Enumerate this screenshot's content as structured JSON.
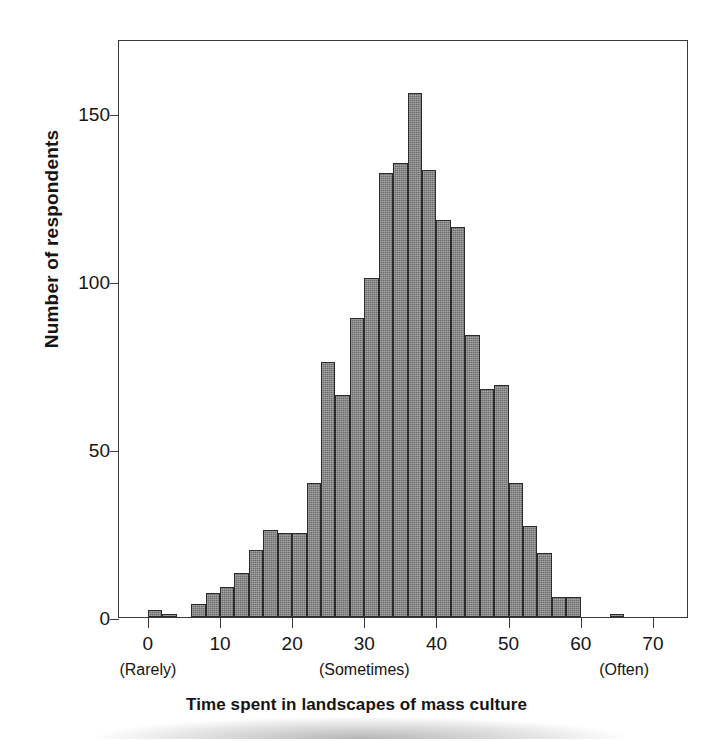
{
  "chart_data": {
    "type": "bar",
    "title": "",
    "subtitle": "",
    "xlabel": "Time spent in landscapes of mass culture",
    "ylabel": "Number of respondents",
    "xlim": [
      -4,
      75
    ],
    "ylim": [
      0,
      172
    ],
    "grid": false,
    "legend": null,
    "bin_width": 2,
    "x_ticks": [
      0,
      10,
      20,
      30,
      40,
      50,
      60,
      70
    ],
    "x_tick_labels": [
      "0",
      "10",
      "20",
      "30",
      "40",
      "50",
      "60",
      "70"
    ],
    "y_ticks": [
      0,
      50,
      100,
      150
    ],
    "y_tick_labels": [
      "0",
      "50",
      "100",
      "150"
    ],
    "anchor_labels": [
      {
        "x": 0,
        "text": "(Rarely)"
      },
      {
        "x": 30,
        "text": "(Sometimes)"
      },
      {
        "x": 66,
        "text": "(Often)"
      }
    ],
    "bar_color": "#6e6e6e",
    "bar_edge_color": "#2b2b2b",
    "bins": [
      {
        "x0": 0,
        "x1": 2,
        "value": 2
      },
      {
        "x0": 2,
        "x1": 4,
        "value": 1
      },
      {
        "x0": 4,
        "x1": 6,
        "value": 0
      },
      {
        "x0": 6,
        "x1": 8,
        "value": 4
      },
      {
        "x0": 8,
        "x1": 10,
        "value": 7
      },
      {
        "x0": 10,
        "x1": 12,
        "value": 9
      },
      {
        "x0": 12,
        "x1": 14,
        "value": 13
      },
      {
        "x0": 14,
        "x1": 16,
        "value": 20
      },
      {
        "x0": 16,
        "x1": 18,
        "value": 26
      },
      {
        "x0": 18,
        "x1": 20,
        "value": 25
      },
      {
        "x0": 20,
        "x1": 22,
        "value": 25
      },
      {
        "x0": 22,
        "x1": 24,
        "value": 40
      },
      {
        "x0": 24,
        "x1": 26,
        "value": 76
      },
      {
        "x0": 26,
        "x1": 28,
        "value": 66
      },
      {
        "x0": 28,
        "x1": 30,
        "value": 89
      },
      {
        "x0": 30,
        "x1": 32,
        "value": 101
      },
      {
        "x0": 32,
        "x1": 34,
        "value": 132
      },
      {
        "x0": 34,
        "x1": 36,
        "value": 135
      },
      {
        "x0": 36,
        "x1": 38,
        "value": 156
      },
      {
        "x0": 38,
        "x1": 40,
        "value": 133
      },
      {
        "x0": 40,
        "x1": 42,
        "value": 118
      },
      {
        "x0": 42,
        "x1": 44,
        "value": 116
      },
      {
        "x0": 44,
        "x1": 46,
        "value": 84
      },
      {
        "x0": 46,
        "x1": 48,
        "value": 68
      },
      {
        "x0": 48,
        "x1": 50,
        "value": 69
      },
      {
        "x0": 50,
        "x1": 52,
        "value": 40
      },
      {
        "x0": 52,
        "x1": 54,
        "value": 27
      },
      {
        "x0": 54,
        "x1": 56,
        "value": 19
      },
      {
        "x0": 56,
        "x1": 58,
        "value": 6
      },
      {
        "x0": 58,
        "x1": 60,
        "value": 6
      },
      {
        "x0": 60,
        "x1": 62,
        "value": 0
      },
      {
        "x0": 62,
        "x1": 64,
        "value": 0
      },
      {
        "x0": 64,
        "x1": 66,
        "value": 1
      }
    ]
  }
}
